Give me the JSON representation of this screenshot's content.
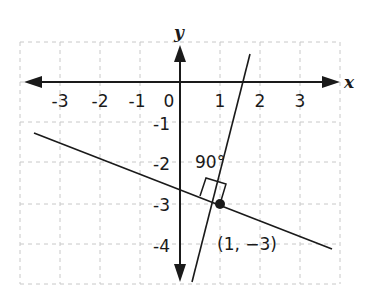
{
  "diagram": {
    "type": "coordinate-plane",
    "axes": {
      "x_label": "x",
      "y_label": "y",
      "x_ticks": [
        "-3",
        "-2",
        "-1",
        "0",
        "1",
        "2",
        "3"
      ],
      "y_ticks": [
        "-1",
        "-2",
        "-3",
        "-4"
      ],
      "x_range": [
        -3.5,
        3.5
      ],
      "y_range": [
        -5,
        1
      ],
      "grid": "dashed"
    },
    "lines": [
      {
        "name": "steep-line",
        "slope": 3,
        "description": "passes through (1, -3) and crosses x-axis near x = 2"
      },
      {
        "name": "shallow-line",
        "slope": -0.333,
        "description": "passes through (1, -3)"
      }
    ],
    "point": {
      "label": "(1, −3)",
      "x": 1,
      "y": -3
    },
    "angle_label": "90°",
    "colors": {
      "ink": "#1a1a1a",
      "grid": "#c8c8c8",
      "background": "#ffffff"
    }
  }
}
